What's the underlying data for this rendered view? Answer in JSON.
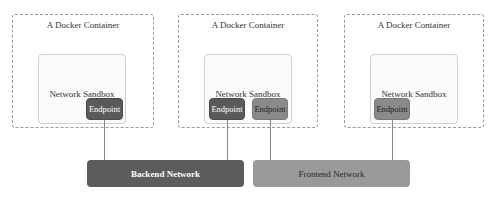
{
  "diagram": {
    "containers": [
      {
        "label": "A Docker Container",
        "sandbox": "Network Sandbox",
        "endpoints": [
          "Endpoint"
        ]
      },
      {
        "label": "A Docker Container",
        "sandbox": "Network Sandbox",
        "endpoints": [
          "Endpoint",
          "Endpoint"
        ]
      },
      {
        "label": "A Docker Container",
        "sandbox": "Network Sandbox",
        "endpoints": [
          "Endpoint"
        ]
      }
    ],
    "networks": [
      {
        "label": "Backend Network",
        "color": "#5c5c5c"
      },
      {
        "label": "Frontend Network",
        "color": "#9a9a9a"
      }
    ]
  }
}
